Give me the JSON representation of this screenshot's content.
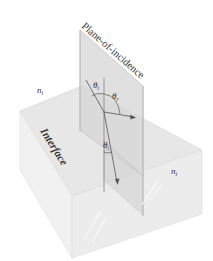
{
  "diagram": {
    "plane_label": "Plane-of-incidence",
    "interface_label": "Interface",
    "n_incident": "n",
    "n_incident_sub": "i",
    "n_transmitted": "n",
    "n_transmitted_sub": "t",
    "theta_i": "θ",
    "theta_i_sub": "i",
    "theta_r": "θ",
    "theta_r_sub": "r",
    "theta_t": "θ",
    "theta_t_sub": "t"
  },
  "colors": {
    "box_top": "#e9e9e9",
    "box_left": "#f0f0f0",
    "box_right": "#ececec",
    "plane": "#d9d9d9",
    "edge": "#c8c8c8",
    "ray": "#555555",
    "text": "#333333"
  }
}
